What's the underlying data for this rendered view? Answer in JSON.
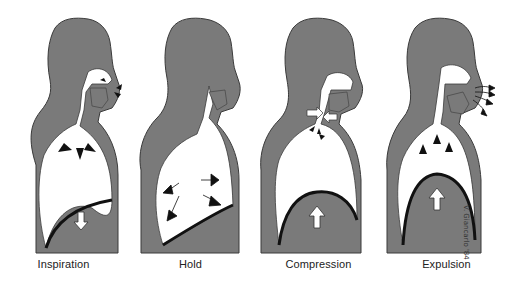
{
  "figure": {
    "colors": {
      "body": "#7a7a7a",
      "outline": "#3a3a3a",
      "airway": "#ffffff",
      "diaphragm": "#111111"
    },
    "signature": "V. Giancarlo '84",
    "panels": [
      {
        "id": "inspiration",
        "label": "Inspiration",
        "diaphragm": "down",
        "arrows": "air-in"
      },
      {
        "id": "hold",
        "label": "Hold",
        "diaphragm": "flat",
        "arrows": "outward"
      },
      {
        "id": "compression",
        "label": "Compression",
        "diaphragm": "up",
        "arrows": "glottis-closed"
      },
      {
        "id": "expulsion",
        "label": "Expulsion",
        "diaphragm": "up",
        "arrows": "air-out"
      }
    ]
  }
}
